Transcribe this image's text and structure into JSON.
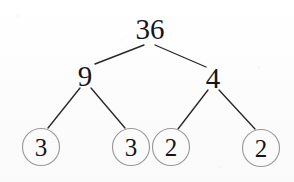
{
  "diagram": {
    "kind": "factor-tree",
    "background_color": "#fdfdfd",
    "text_color": "#15151a",
    "line_color": "#26262c",
    "circle_stroke_color": "#9a9a9e",
    "nodes": [
      {
        "id": "root",
        "label": "36",
        "x": 150,
        "y": 29,
        "font_size": 29,
        "circled": false
      },
      {
        "id": "l1",
        "label": "9",
        "x": 85,
        "y": 76,
        "font_size": 29,
        "circled": false
      },
      {
        "id": "r1",
        "label": "4",
        "x": 213,
        "y": 78,
        "font_size": 29,
        "circled": false
      },
      {
        "id": "leaf1",
        "label": "3",
        "x": 41,
        "y": 147,
        "font_size": 25,
        "circled": true,
        "radius": 18.5
      },
      {
        "id": "leaf2",
        "label": "3",
        "x": 131,
        "y": 147,
        "font_size": 25,
        "circled": true,
        "radius": 18.5
      },
      {
        "id": "leaf3",
        "label": "2",
        "x": 171,
        "y": 147,
        "font_size": 25,
        "circled": true,
        "radius": 18.5
      },
      {
        "id": "leaf4",
        "label": "2",
        "x": 261,
        "y": 148,
        "font_size": 25,
        "circled": true,
        "radius": 18.5
      }
    ],
    "edges": [
      {
        "id": "e-root-l1",
        "from": "root",
        "to": "l1",
        "x1": 144,
        "y1": 45,
        "x2": 95,
        "y2": 64
      },
      {
        "id": "e-root-r1",
        "from": "root",
        "to": "r1",
        "x1": 155,
        "y1": 45,
        "x2": 206,
        "y2": 67
      },
      {
        "id": "e-l1-f1",
        "from": "l1",
        "to": "leaf1",
        "x1": 80,
        "y1": 88,
        "x2": 48,
        "y2": 128
      },
      {
        "id": "e-l1-f2",
        "from": "l1",
        "to": "leaf2",
        "x1": 91,
        "y1": 88,
        "x2": 125,
        "y2": 128
      },
      {
        "id": "e-r1-f3",
        "from": "r1",
        "to": "leaf3",
        "x1": 208,
        "y1": 90,
        "x2": 178,
        "y2": 129
      },
      {
        "id": "e-r1-f4",
        "from": "r1",
        "to": "leaf4",
        "x1": 219,
        "y1": 90,
        "x2": 255,
        "y2": 129
      }
    ]
  },
  "labels": {
    "root": "36",
    "left_branch": "9",
    "right_branch": "4",
    "leaf_1": "3",
    "leaf_2": "3",
    "leaf_3": "2",
    "leaf_4": "2"
  }
}
